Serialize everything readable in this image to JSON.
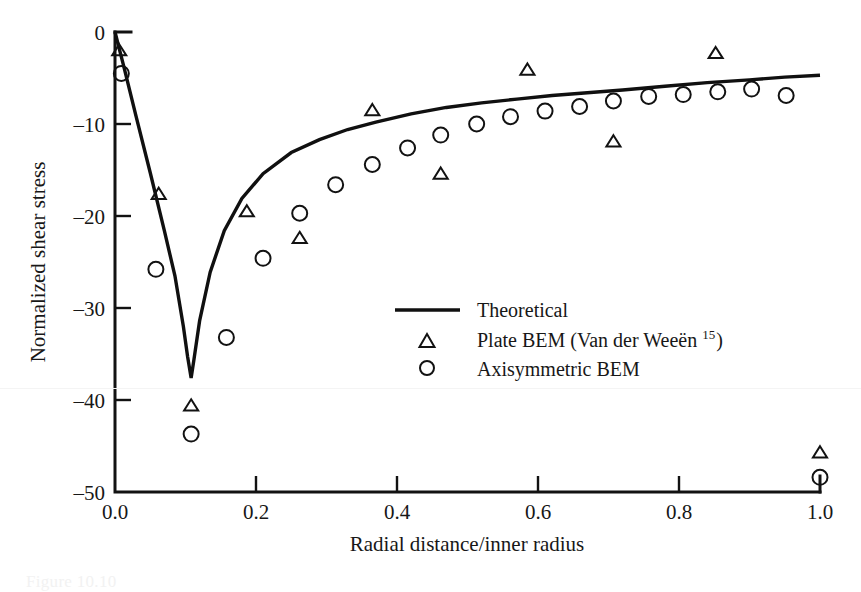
{
  "figure": {
    "caption_partial": "Figure 10.10",
    "background": "#ffffff",
    "ink": "#121212"
  },
  "chart_data": {
    "type": "scatter",
    "title": "",
    "xlabel": "Radial distance/inner radius",
    "ylabel": "Normalized shear stress",
    "xlim": [
      0.0,
      1.0
    ],
    "ylim": [
      -50,
      0
    ],
    "xticks": [
      0.0,
      0.2,
      0.4,
      0.6,
      0.8,
      1.0
    ],
    "xtick_labels": [
      "0.0",
      "0.2",
      "0.4",
      "0.6",
      "0.8",
      "1.0"
    ],
    "yticks": [
      0,
      -10,
      -20,
      -30,
      -40,
      -50
    ],
    "ytick_labels": [
      "0",
      "–10",
      "–20",
      "–30",
      "–40",
      "–50"
    ],
    "grid": false,
    "legend_position": "center-right",
    "series": [
      {
        "name": "Theoretical",
        "marker": "line",
        "type": "line",
        "x": [
          0.0,
          0.012,
          0.03,
          0.05,
          0.07,
          0.085,
          0.097,
          0.103,
          0.108,
          0.112,
          0.12,
          0.135,
          0.155,
          0.18,
          0.21,
          0.25,
          0.29,
          0.33,
          0.37,
          0.42,
          0.47,
          0.52,
          0.57,
          0.62,
          0.67,
          0.72,
          0.78,
          0.84,
          0.9,
          0.95,
          1.0
        ],
        "y": [
          0.0,
          -3.6,
          -9.2,
          -15.3,
          -21.6,
          -26.5,
          -32.0,
          -35.3,
          -37.6,
          -35.6,
          -31.4,
          -26.1,
          -21.6,
          -18.1,
          -15.4,
          -13.1,
          -11.7,
          -10.6,
          -9.8,
          -8.9,
          -8.2,
          -7.7,
          -7.3,
          -6.9,
          -6.6,
          -6.3,
          -5.9,
          -5.5,
          -5.2,
          -4.9,
          -4.7
        ]
      },
      {
        "name": "Plate BEM (Van der Weeën ¹⁵)",
        "marker": "triangle",
        "type": "scatter",
        "reference": "15",
        "x": [
          0.006,
          0.062,
          0.108,
          0.187,
          0.262,
          0.365,
          0.462,
          0.585,
          0.707,
          0.852,
          1.0
        ],
        "y": [
          -2.0,
          -17.6,
          -40.6,
          -19.5,
          -22.4,
          -8.5,
          -15.4,
          -4.1,
          -11.9,
          -2.3,
          -45.7
        ]
      },
      {
        "name": "Axisymmetric BEM",
        "marker": "circle",
        "type": "scatter",
        "x": [
          0.009,
          0.058,
          0.108,
          0.158,
          0.21,
          0.262,
          0.313,
          0.365,
          0.415,
          0.462,
          0.513,
          0.561,
          0.61,
          0.659,
          0.707,
          0.757,
          0.806,
          0.855,
          0.903,
          0.952,
          1.0
        ],
        "y": [
          -4.5,
          -25.8,
          -43.7,
          -33.2,
          -24.6,
          -19.7,
          -16.6,
          -14.4,
          -12.6,
          -11.2,
          -10.0,
          -9.2,
          -8.6,
          -8.1,
          -7.5,
          -7.0,
          -6.8,
          -6.5,
          -6.2,
          -6.9,
          -48.4
        ]
      }
    ],
    "legend_entries": [
      {
        "label": "Theoretical",
        "marker": "line",
        "sup": ""
      },
      {
        "label": "Plate BEM (Van der Weeën",
        "marker": "triangle",
        "sup": "15",
        "tail": ")"
      },
      {
        "label": "Axisymmetric BEM",
        "marker": "circle",
        "sup": ""
      }
    ]
  }
}
